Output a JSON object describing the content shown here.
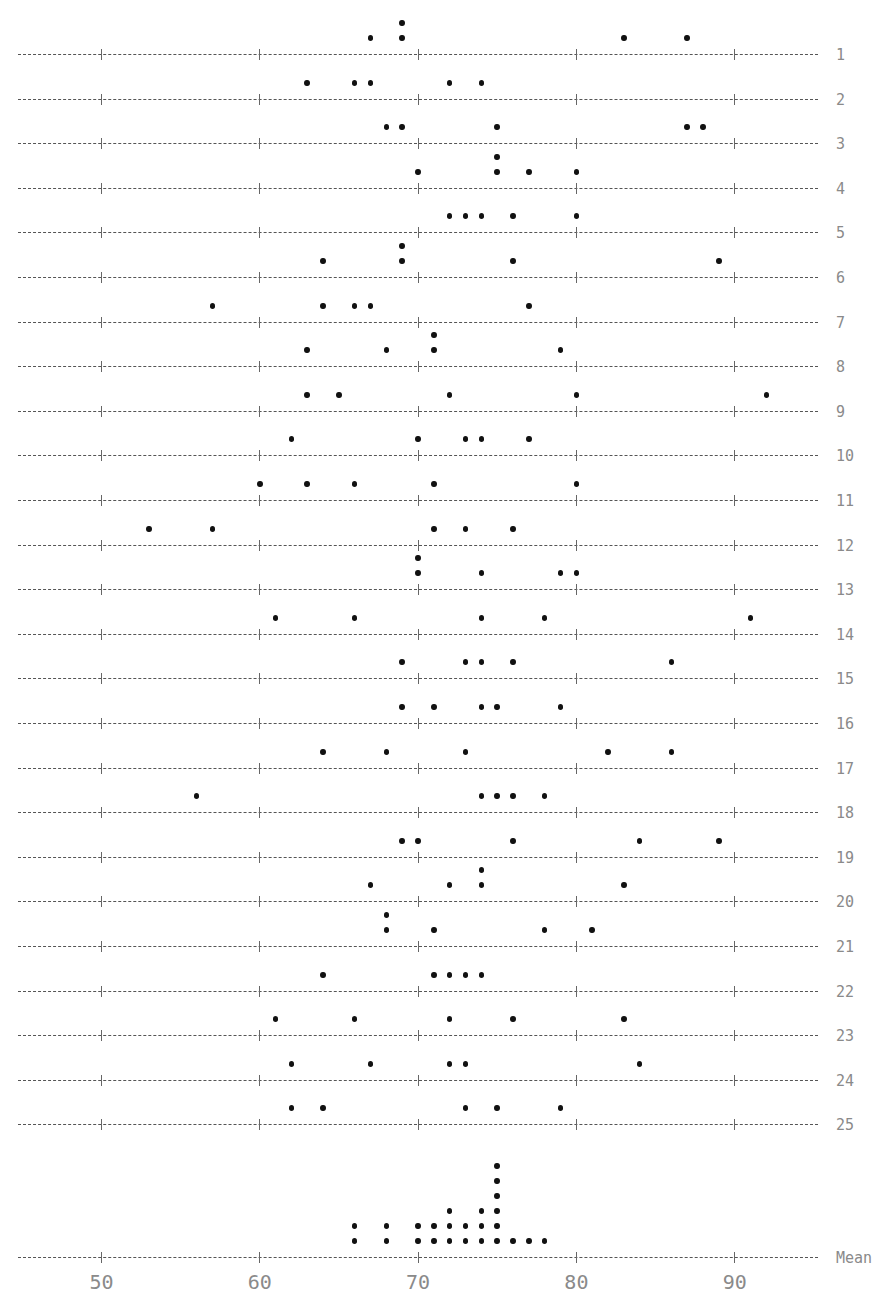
{
  "chart_data": {
    "type": "dotplot",
    "title": "",
    "xlabel": "",
    "ylabel": "",
    "xlim": [
      45,
      96
    ],
    "x_ticks": [
      50,
      60,
      70,
      80,
      90
    ],
    "x_tick_labels": [
      "50",
      "60",
      "70",
      "80",
      "90"
    ],
    "grid": false,
    "rows": [
      {
        "label": "1",
        "values": [
          67,
          69,
          69,
          83,
          87
        ]
      },
      {
        "label": "2",
        "values": [
          63,
          66,
          67,
          72,
          74
        ]
      },
      {
        "label": "3",
        "values": [
          68,
          69,
          75,
          87,
          88
        ]
      },
      {
        "label": "4",
        "values": [
          70,
          75,
          75,
          77,
          80
        ]
      },
      {
        "label": "5",
        "values": [
          72,
          73,
          74,
          76,
          80
        ]
      },
      {
        "label": "6",
        "values": [
          64,
          69,
          69,
          76,
          89
        ]
      },
      {
        "label": "7",
        "values": [
          57,
          64,
          66,
          67,
          77
        ]
      },
      {
        "label": "8",
        "values": [
          63,
          68,
          71,
          71,
          79
        ]
      },
      {
        "label": "9",
        "values": [
          63,
          65,
          72,
          80,
          92
        ]
      },
      {
        "label": "10",
        "values": [
          62,
          70,
          73,
          74,
          77
        ]
      },
      {
        "label": "11",
        "values": [
          60,
          63,
          66,
          71,
          80
        ]
      },
      {
        "label": "12",
        "values": [
          53,
          57,
          71,
          73,
          76
        ]
      },
      {
        "label": "13",
        "values": [
          70,
          70,
          74,
          79,
          80
        ]
      },
      {
        "label": "14",
        "values": [
          61,
          66,
          74,
          78,
          91
        ]
      },
      {
        "label": "15",
        "values": [
          69,
          73,
          74,
          76,
          86
        ]
      },
      {
        "label": "16",
        "values": [
          69,
          71,
          74,
          75,
          79
        ]
      },
      {
        "label": "17",
        "values": [
          64,
          68,
          73,
          82,
          86
        ]
      },
      {
        "label": "18",
        "values": [
          56,
          74,
          75,
          76,
          78
        ]
      },
      {
        "label": "19",
        "values": [
          69,
          70,
          76,
          84,
          89
        ]
      },
      {
        "label": "20",
        "values": [
          67,
          72,
          74,
          74,
          83
        ]
      },
      {
        "label": "21",
        "values": [
          68,
          68,
          71,
          78,
          81
        ]
      },
      {
        "label": "22",
        "values": [
          64,
          71,
          72,
          73,
          74
        ]
      },
      {
        "label": "23",
        "values": [
          61,
          66,
          72,
          76,
          83
        ]
      },
      {
        "label": "24",
        "values": [
          62,
          67,
          72,
          73,
          84
        ]
      },
      {
        "label": "25",
        "values": [
          62,
          64,
          73,
          75,
          79
        ]
      }
    ],
    "mean_row": {
      "label": "Mean",
      "values": [
        66,
        66,
        68,
        68,
        70,
        70,
        71,
        71,
        72,
        72,
        72,
        73,
        73,
        74,
        74,
        74,
        75,
        75,
        75,
        75,
        75,
        75,
        76,
        77,
        78
      ]
    }
  },
  "colors": {
    "dot": "#111111",
    "axis": "#555555",
    "label": "#8a8a8a",
    "background": "#ffffff"
  }
}
